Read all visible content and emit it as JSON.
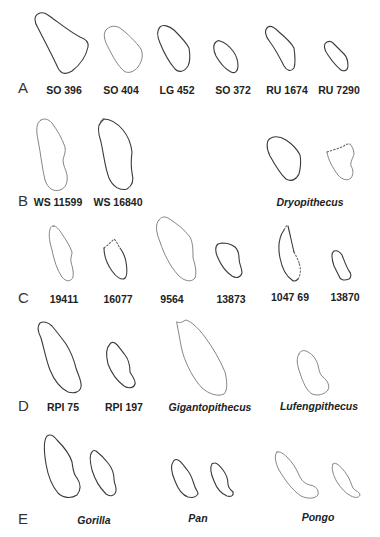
{
  "figure": {
    "rows": [
      {
        "letter": "A",
        "specimens": [
          {
            "label": "SO 396",
            "italic": false
          },
          {
            "label": "SO 404",
            "italic": false
          },
          {
            "label": "LG 452",
            "italic": false
          },
          {
            "label": "SO 372",
            "italic": false
          },
          {
            "label": "RU 1674",
            "italic": false
          },
          {
            "label": "RU 7290",
            "italic": false
          }
        ]
      },
      {
        "letter": "B",
        "specimens": [
          {
            "label": "WS 11599",
            "italic": false
          },
          {
            "label": "WS 16840",
            "italic": false
          },
          {
            "label": "Dryopithecus",
            "italic": true
          }
        ]
      },
      {
        "letter": "C",
        "specimens": [
          {
            "label": "19411",
            "italic": false
          },
          {
            "label": "16077",
            "italic": false
          },
          {
            "label": "9564",
            "italic": false
          },
          {
            "label": "13873",
            "italic": false
          },
          {
            "label": "1047 69",
            "italic": false
          },
          {
            "label": "13870",
            "italic": false
          }
        ]
      },
      {
        "letter": "D",
        "specimens": [
          {
            "label": "RPI 75",
            "italic": false
          },
          {
            "label": "RPI 197",
            "italic": false
          },
          {
            "label": "Gigantopithecus",
            "italic": true
          },
          {
            "label": "Lufengpithecus",
            "italic": true
          }
        ]
      },
      {
        "letter": "E",
        "specimens": [
          {
            "label": "Gorilla",
            "italic": true
          },
          {
            "label": "Pan",
            "italic": true
          },
          {
            "label": "Pongo",
            "italic": true
          }
        ]
      }
    ]
  }
}
